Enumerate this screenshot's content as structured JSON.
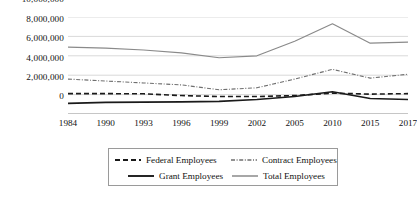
{
  "chart_data": {
    "type": "line",
    "title": "",
    "subtitle": "",
    "xlabel": "",
    "ylabel": "",
    "categories": [
      "1984",
      "1990",
      "1993",
      "1996",
      "1999",
      "2002",
      "2005",
      "2010",
      "2015",
      "2017"
    ],
    "ylim": [
      0,
      10000000
    ],
    "ytick_values": [
      0,
      2000000,
      4000000,
      6000000,
      8000000,
      10000000
    ],
    "ytick_labels": [
      "0",
      "2,000,000",
      "4,000,000",
      "6,000,000",
      "8,000,000",
      "10,000,000"
    ],
    "grid": true,
    "grid_axis": "y",
    "legend_position": "bottom",
    "series": [
      {
        "name": "Federal Employees",
        "style": "dashed",
        "color": "#1a1a1a",
        "width": 1.6,
        "values": [
          2100000,
          2100000,
          2080000,
          1900000,
          1800000,
          1800000,
          1900000,
          2150000,
          2050000,
          2100000
        ]
      },
      {
        "name": "Contract Employees",
        "style": "fine-dash",
        "color": "#6f6f6f",
        "width": 1.1,
        "values": [
          3600000,
          3400000,
          3200000,
          3000000,
          2500000,
          2700000,
          3600000,
          4600000,
          3700000,
          4100000
        ]
      },
      {
        "name": "Grant Employees",
        "style": "solid",
        "color": "#1a1a1a",
        "width": 1.6,
        "values": [
          1100000,
          1200000,
          1220000,
          1250000,
          1300000,
          1500000,
          1800000,
          2300000,
          1600000,
          1500000
        ]
      },
      {
        "name": "Total Employees",
        "style": "solid",
        "color": "#8a8a8a",
        "width": 1.2,
        "values": [
          6900000,
          6800000,
          6600000,
          6300000,
          5800000,
          6000000,
          7500000,
          9300000,
          7300000,
          7400000
        ]
      }
    ]
  },
  "legend": {
    "items": [
      {
        "label": "Federal Employees"
      },
      {
        "label": "Contract Employees"
      },
      {
        "label": "Grant Employees"
      },
      {
        "label": "Total Employees"
      }
    ]
  }
}
